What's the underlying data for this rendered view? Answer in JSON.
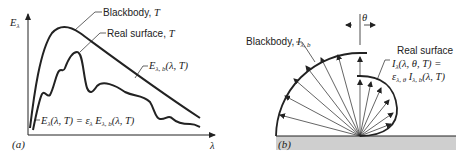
{
  "panel_a": {
    "label": "(a)",
    "y_axis_label": "E",
    "y_axis_sub": "λ",
    "x_axis_label": "λ",
    "blackbody_label": "Blackbody, ",
    "blackbody_T": "T",
    "real_label": "Real surface, ",
    "real_T": "T",
    "blackbody_eq": {
      "main": "E",
      "sub": "λ, b",
      "args": "(λ, T)"
    },
    "real_eq": {
      "lhs": "E",
      "lhs_sub": "λ",
      "lhs_args": "(λ, T) = ε",
      "eps_sub": "λ",
      "rhs": " E",
      "rhs_sub": "λ, b",
      "rhs_args": "(λ, T)"
    }
  },
  "panel_b": {
    "label": "(b)",
    "theta": "θ",
    "blackbody_label": "Blackbody, ",
    "blackbody_I": "I",
    "blackbody_I_sub": "λ, b",
    "real_title": "Real surface",
    "real_eq_line1": {
      "main": "I",
      "sub": "λ",
      "args": "(λ, θ, T) ="
    },
    "real_eq_line2": {
      "eps": "ε",
      "eps_sub": "λ, θ",
      "main": " I",
      "sub": "λ, b",
      "args": "(λ, T)"
    }
  },
  "colors": {
    "ink": "#222222",
    "ground": "#cfcfcf"
  }
}
